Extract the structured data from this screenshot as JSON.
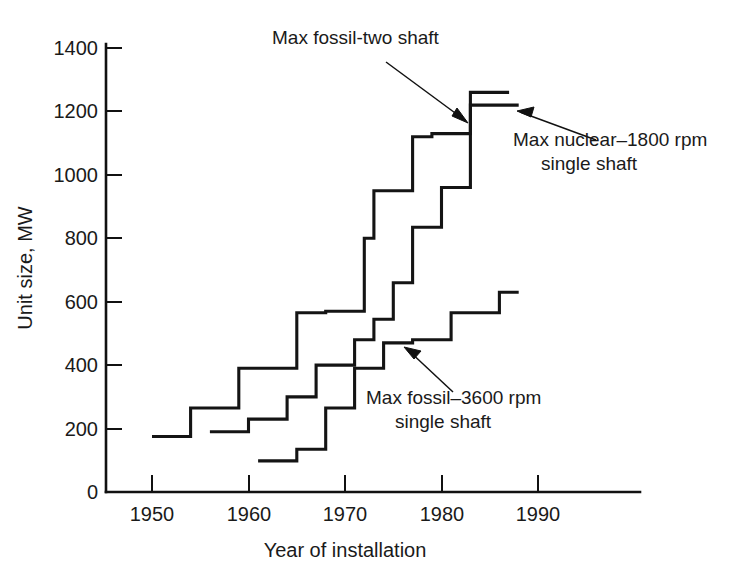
{
  "chart_data": {
    "type": "line",
    "title": "",
    "xlabel": "Year of installation",
    "ylabel": "Unit size, MW",
    "xlim": [
      1946,
      1995
    ],
    "ylim": [
      0,
      1480
    ],
    "xticks": [
      "1950",
      "1960",
      "1970",
      "1980",
      "1990"
    ],
    "xtick_values": [
      1950,
      1960,
      1970,
      1980,
      1990
    ],
    "yticks": [
      "0",
      "200",
      "400",
      "600",
      "800",
      "1000",
      "1200",
      "1400"
    ],
    "ytick_values": [
      0,
      200,
      400,
      600,
      800,
      1000,
      1200,
      1400
    ],
    "grid": false,
    "legend": "none",
    "step_style": "post",
    "series": [
      {
        "name": "Max fossil-two shaft",
        "x": [
          1950,
          1954,
          1954,
          1959,
          1959,
          1965,
          1965,
          1968,
          1968,
          1972,
          1972,
          1973,
          1973,
          1977,
          1977,
          1979,
          1979,
          1983,
          1983,
          1987
        ],
        "y": [
          175,
          175,
          265,
          265,
          390,
          390,
          565,
          565,
          570,
          570,
          800,
          800,
          950,
          950,
          1120,
          1120,
          1130,
          1130,
          1260,
          1260
        ],
        "points": [
          {
            "year": 1950,
            "value": 175
          },
          {
            "year": 1954,
            "value": 265
          },
          {
            "year": 1959,
            "value": 390
          },
          {
            "year": 1965,
            "value": 565
          },
          {
            "year": 1968,
            "value": 570
          },
          {
            "year": 1972,
            "value": 800
          },
          {
            "year": 1973,
            "value": 950
          },
          {
            "year": 1977,
            "value": 1120
          },
          {
            "year": 1979,
            "value": 1130
          },
          {
            "year": 1983,
            "value": 1260
          }
        ]
      },
      {
        "name": "Max nuclear-1800 rpm single shaft",
        "x": [
          1956,
          1960,
          1960,
          1964,
          1964,
          1967,
          1967,
          1971,
          1971,
          1973,
          1973,
          1975,
          1975,
          1977,
          1977,
          1980,
          1980,
          1983,
          1983,
          1988
        ],
        "y": [
          190,
          190,
          230,
          230,
          300,
          300,
          400,
          400,
          480,
          480,
          545,
          545,
          660,
          660,
          835,
          835,
          960,
          960,
          1220,
          1220
        ],
        "points": [
          {
            "year": 1956,
            "value": 190
          },
          {
            "year": 1960,
            "value": 230
          },
          {
            "year": 1964,
            "value": 300
          },
          {
            "year": 1967,
            "value": 400
          },
          {
            "year": 1971,
            "value": 480
          },
          {
            "year": 1973,
            "value": 545
          },
          {
            "year": 1975,
            "value": 660
          },
          {
            "year": 1977,
            "value": 835
          },
          {
            "year": 1980,
            "value": 960
          },
          {
            "year": 1983,
            "value": 1220
          }
        ]
      },
      {
        "name": "Max fossil-3600 rpm single shaft",
        "x": [
          1961,
          1965,
          1965,
          1968,
          1968,
          1971,
          1971,
          1974,
          1974,
          1977,
          1977,
          1981,
          1981,
          1986,
          1986,
          1988
        ],
        "y": [
          98,
          98,
          135,
          135,
          265,
          265,
          390,
          390,
          470,
          470,
          480,
          480,
          565,
          565,
          630,
          630
        ],
        "points": [
          {
            "year": 1961,
            "value": 98
          },
          {
            "year": 1965,
            "value": 135
          },
          {
            "year": 1968,
            "value": 265
          },
          {
            "year": 1971,
            "value": 390
          },
          {
            "year": 1974,
            "value": 470
          },
          {
            "year": 1977,
            "value": 480
          },
          {
            "year": 1981,
            "value": 565
          },
          {
            "year": 1986,
            "value": 630
          }
        ]
      }
    ],
    "annotations": [
      {
        "id": "fossil-two-shaft",
        "lines": [
          "Max fossil-two shaft"
        ],
        "text": "Max fossil-two shaft",
        "points_to": {
          "year": 1983,
          "value": 1150
        }
      },
      {
        "id": "nuclear-1800",
        "lines": [
          "Max nuclear–1800 rpm",
          "single shaft"
        ],
        "text": "Max nuclear–1800 rpm single shaft",
        "points_to": {
          "year": 1984,
          "value": 1215
        }
      },
      {
        "id": "fossil-3600",
        "lines": [
          "Max fossil–3600 rpm",
          "single shaft"
        ],
        "text": "Max fossil–3600 rpm single shaft",
        "points_to": {
          "year": 1974,
          "value": 465
        }
      }
    ]
  },
  "colors": {
    "background": "#ffffff",
    "ink": "#111111",
    "series": "#141414"
  }
}
